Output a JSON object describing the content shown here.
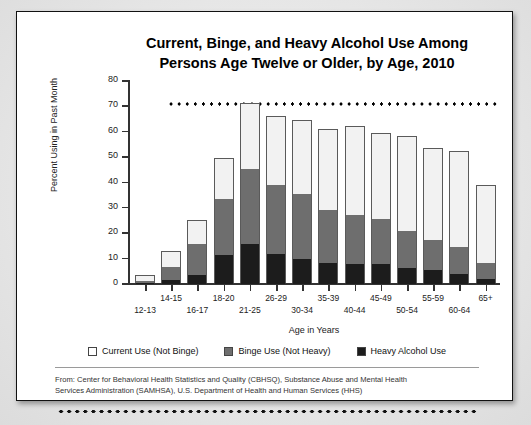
{
  "chart_data": {
    "type": "bar",
    "stacked": true,
    "title": "Current, Binge, and Heavy Alcohol Use Among Persons Age Twelve or Older, by Age, 2010",
    "title_line1": "Current, Binge, and Heavy Alcohol Use Among",
    "title_line2": "Persons Age Twelve or Older, by Age, 2010",
    "xlabel": "Age in Years",
    "ylabel": "Percent Using in Past Month",
    "ylim": [
      0,
      80
    ],
    "yticks": [
      0,
      10,
      20,
      30,
      40,
      50,
      60,
      70,
      80
    ],
    "grid": false,
    "legend_position": "bottom",
    "categories": [
      "12-13",
      "14-15",
      "16-17",
      "18-20",
      "21-25",
      "26-29",
      "30-34",
      "35-39",
      "40-44",
      "45-49",
      "50-54",
      "55-59",
      "60-64",
      "65+"
    ],
    "series": [
      {
        "name": "Heavy Alcohol Use",
        "color": "#1c1c1c",
        "values": [
          0.3,
          1.5,
          3.6,
          11.5,
          15.6,
          11.8,
          9.8,
          8.3,
          7.8,
          7.7,
          6.6,
          5.7,
          3.9,
          2.1
        ]
      },
      {
        "name": "Binge Use (Not Heavy)",
        "color": "#6e6e6e",
        "values": [
          1.0,
          5.3,
          12.0,
          22.0,
          29.9,
          27.3,
          25.5,
          20.8,
          19.2,
          17.8,
          14.5,
          11.7,
          10.6,
          6.3
        ]
      },
      {
        "name": "Current Use (Not Binge)",
        "color": "#f2f2f2",
        "values": [
          1.7,
          5.7,
          9.2,
          15.8,
          25.3,
          26.7,
          29.0,
          31.7,
          34.7,
          33.7,
          37.1,
          35.8,
          37.7,
          30.4
        ]
      }
    ],
    "totals": [
      3.0,
      12.5,
      24.8,
      49.3,
      70.8,
      65.8,
      64.3,
      60.8,
      61.7,
      59.2,
      58.0,
      53.2,
      52.2,
      38.8
    ]
  },
  "legend": {
    "items": [
      {
        "label": "Current Use (Not Binge)",
        "swatch": "white-square-icon"
      },
      {
        "label": "Binge Use (Not Heavy)",
        "swatch": "gray-square-icon"
      },
      {
        "label": "Heavy Alcohol Use",
        "swatch": "black-square-icon"
      }
    ]
  },
  "source": {
    "line1": "From: Center for Behavioral Health Statistics and Quality (CBHSQ), Substance Abuse and Mental Health",
    "line2": "Services Administration (SAMHSA), U.S. Department of Health and Human Services (HHS)"
  }
}
